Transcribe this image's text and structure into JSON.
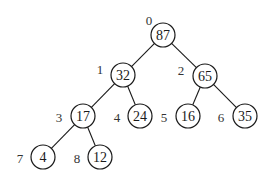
{
  "diagram": {
    "type": "binary-heap-tree",
    "radius": 12,
    "nodes": [
      {
        "index": "0",
        "value": "87",
        "x": 163,
        "y": 35,
        "lx": 149,
        "ly": 20
      },
      {
        "index": "1",
        "value": "32",
        "x": 123,
        "y": 75,
        "lx": 100,
        "ly": 69
      },
      {
        "index": "2",
        "value": "65",
        "x": 205,
        "y": 76,
        "lx": 181,
        "ly": 70
      },
      {
        "index": "3",
        "value": "17",
        "x": 83,
        "y": 116,
        "lx": 59,
        "ly": 117
      },
      {
        "index": "4",
        "value": "24",
        "x": 140,
        "y": 116,
        "lx": 117,
        "ly": 117
      },
      {
        "index": "5",
        "value": "16",
        "x": 188,
        "y": 116,
        "lx": 164,
        "ly": 117
      },
      {
        "index": "6",
        "value": "35",
        "x": 245,
        "y": 116,
        "lx": 221,
        "ly": 117
      },
      {
        "index": "7",
        "value": "4",
        "x": 43,
        "y": 157,
        "lx": 20,
        "ly": 158
      },
      {
        "index": "8",
        "value": "12",
        "x": 100,
        "y": 157,
        "lx": 77,
        "ly": 158
      }
    ],
    "edges": [
      [
        0,
        1
      ],
      [
        0,
        2
      ],
      [
        1,
        3
      ],
      [
        1,
        4
      ],
      [
        2,
        5
      ],
      [
        2,
        6
      ],
      [
        3,
        7
      ],
      [
        3,
        8
      ]
    ]
  }
}
